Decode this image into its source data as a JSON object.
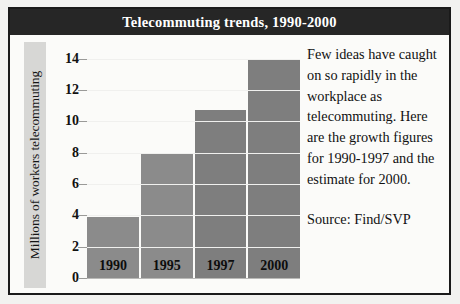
{
  "title": "Telecommuting trends, 1990-2000",
  "commentary": {
    "paragraph": "Few ideas have caught on so rapidly in the workplace as telecommuting. Here are the growth figures for 1990-1997 and the estimate for 2000.",
    "source": "Source: Find/SVP"
  },
  "colors": {
    "title_bar": "#262626",
    "title_text": "#ffffff",
    "bar_fill": "#8b8b8b",
    "bar_fill_dark": "#7e7e7e",
    "gridline": "#c9c9c7",
    "ylabel_band": "#d7d7d5",
    "panel": "#fbfbf9",
    "frame": "#1a1a1a"
  },
  "chart_data": {
    "type": "bar",
    "title": "Telecommuting trends, 1990-2000",
    "categories": [
      "1990",
      "1995",
      "1997",
      "2000"
    ],
    "values": [
      3.9,
      8.0,
      10.7,
      13.9
    ],
    "xlabel": "",
    "ylabel": "Millions of workers telecommuting",
    "ylim": [
      0,
      14.8
    ],
    "yticks": [
      0,
      2,
      4,
      6,
      8,
      10,
      12,
      14
    ],
    "ytick_labels": [
      "0",
      "2",
      "4",
      "6",
      "8",
      "10",
      "12",
      "14"
    ],
    "grid": true,
    "legend": false,
    "bar_label_position": "inside-bottom",
    "annotation": "Few ideas have caught on so rapidly in the workplace as telecommuting. Here are the growth figures for 1990-1997 and the estimate for 2000.",
    "source": "Source: Find/SVP"
  }
}
